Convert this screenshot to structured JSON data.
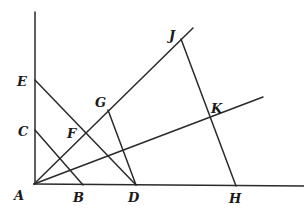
{
  "diagram": {
    "type": "geometric-construction",
    "points": {
      "A": {
        "label": "A",
        "x": 34,
        "y": 184,
        "lx": 14,
        "ly": 200
      },
      "B": {
        "label": "B",
        "x": 83,
        "y": 185,
        "lx": 73,
        "ly": 202
      },
      "C": {
        "label": "C",
        "x": 35,
        "y": 130,
        "lx": 18,
        "ly": 136
      },
      "D": {
        "label": "D",
        "x": 136,
        "y": 185,
        "lx": 128,
        "ly": 202
      },
      "E": {
        "label": "E",
        "x": 35,
        "y": 80,
        "lx": 17,
        "ly": 86
      },
      "F": {
        "label": "F",
        "x": 85,
        "y": 133,
        "lx": 67,
        "ly": 138
      },
      "G": {
        "label": "G",
        "x": 108,
        "y": 110,
        "lx": 95,
        "ly": 107
      },
      "H": {
        "label": "H",
        "x": 236,
        "y": 186,
        "lx": 229,
        "ly": 203
      },
      "J": {
        "label": "J",
        "x": 181,
        "y": 39,
        "lx": 169,
        "ly": 40
      },
      "K": {
        "label": "K",
        "x": 211,
        "y": 117,
        "lx": 211,
        "ly": 113
      }
    },
    "segments": [
      {
        "name": "vertical-axis",
        "from": "A",
        "x1": 35,
        "y1": 12,
        "x2": 35,
        "y2": 184
      },
      {
        "name": "horizontal-axis",
        "from": "A",
        "x1": 34,
        "y1": 184,
        "x2": 304,
        "y2": 186
      },
      {
        "name": "ray-A-J",
        "x1": 34,
        "y1": 184,
        "x2": 193,
        "y2": 28
      },
      {
        "name": "ray-A-K",
        "x1": 34,
        "y1": 184,
        "x2": 263,
        "y2": 97
      },
      {
        "name": "segment-E-D",
        "x1": 35,
        "y1": 80,
        "x2": 136,
        "y2": 185
      },
      {
        "name": "segment-C-B",
        "x1": 35,
        "y1": 130,
        "x2": 83,
        "y2": 185
      },
      {
        "name": "segment-G-D",
        "x1": 108,
        "y1": 110,
        "x2": 136,
        "y2": 185
      },
      {
        "name": "segment-J-H",
        "x1": 181,
        "y1": 39,
        "x2": 236,
        "y2": 186
      }
    ]
  }
}
